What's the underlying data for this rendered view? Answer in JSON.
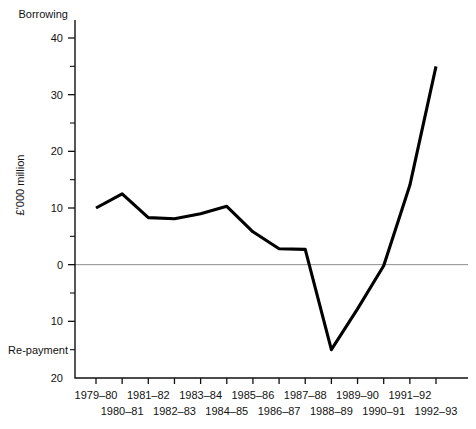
{
  "chart_data": {
    "type": "line",
    "title": "",
    "xlabel": "",
    "ylabel": "£'000 million",
    "ylim": [
      -20,
      45
    ],
    "grid": false,
    "legend": "none",
    "top_region_label": "Borrowing",
    "bottom_region_label": "Re-payment",
    "zero_reference_line": 0,
    "y_ticks_major": [
      {
        "value": 40,
        "label": "40"
      },
      {
        "value": 30,
        "label": "30"
      },
      {
        "value": 20,
        "label": "20"
      },
      {
        "value": 10,
        "label": "10"
      },
      {
        "value": 0,
        "label": "0"
      },
      {
        "value": -10,
        "label": "10"
      },
      {
        "value": -20,
        "label": "20"
      }
    ],
    "y_ticks_minor": [
      35,
      25,
      15,
      5,
      -5,
      -15
    ],
    "categories": [
      "1979–80",
      "1980–81",
      "1981–82",
      "1982–83",
      "1983–84",
      "1984–85",
      "1985–86",
      "1986–87",
      "1987–88",
      "1988–89",
      "1989–90",
      "1990–91",
      "1991–92",
      "1992–93"
    ],
    "x_tick_labels_row_upper": [
      "1979–80",
      "1981–82",
      "1983–84",
      "1985–86",
      "1987–88",
      "1989–90",
      "1991–92"
    ],
    "x_tick_labels_row_lower": [
      "1980–81",
      "1982–83",
      "1984–85",
      "1986–87",
      "1988–89",
      "1990–91",
      "1992–93"
    ],
    "values": [
      10.0,
      12.5,
      8.3,
      8.1,
      9.0,
      10.3,
      5.8,
      2.8,
      2.7,
      -15.0,
      -7.8,
      -0.2,
      14.0,
      35.0
    ],
    "series": [
      {
        "name": "Public sector borrowing requirement",
        "values": [
          10.0,
          12.5,
          8.3,
          8.1,
          9.0,
          10.3,
          5.8,
          2.8,
          2.7,
          -15.0,
          -7.8,
          -0.2,
          14.0,
          35.0
        ]
      }
    ],
    "line_color": "#000000",
    "zero_line_color": "#8b8b8b"
  }
}
